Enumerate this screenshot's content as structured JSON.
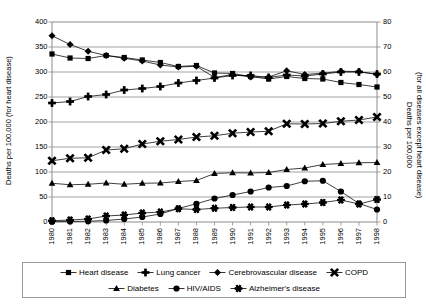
{
  "chart_data": {
    "type": "line",
    "title": "",
    "xlabel": "",
    "categories": [
      "1980",
      "1981",
      "1982",
      "1983",
      "1984",
      "1985",
      "1986",
      "1987",
      "1988",
      "1989",
      "1990",
      "1991",
      "1992",
      "1993",
      "1994",
      "1995",
      "1996",
      "1997",
      "1998"
    ],
    "axes": {
      "left": {
        "label": "Deaths per 100,000 (for heart disease)",
        "ticks": [
          "0",
          "50",
          "100",
          "150",
          "200",
          "250",
          "300",
          "350",
          "400"
        ],
        "lim": [
          0,
          400
        ]
      },
      "right": {
        "label_line1": "Deaths per 100,000",
        "label_line2": "(for all diseases except heart disease)",
        "ticks": [
          "0",
          "10",
          "20",
          "30",
          "40",
          "50",
          "60",
          "70",
          "80"
        ],
        "lim": [
          0,
          80
        ]
      }
    },
    "grid": true,
    "legend_position": "bottom",
    "series": [
      {
        "name": "Heart disease",
        "axis": "left",
        "marker": "square",
        "values": [
          336,
          328,
          327,
          333,
          329,
          324,
          319,
          311,
          313,
          298,
          297,
          291,
          286,
          291,
          287,
          286,
          279,
          275,
          270
        ]
      },
      {
        "name": "Lung cancer",
        "axis": "left",
        "marker": "plus",
        "values": [
          238,
          241,
          251,
          255,
          264,
          267,
          271,
          278,
          283,
          288,
          293,
          293,
          289,
          294,
          292,
          296,
          300,
          300,
          296
        ]
      },
      {
        "name": "Cerebrovascular disease",
        "axis": "right",
        "marker": "diamond",
        "values": [
          74.5,
          71.0,
          68.3,
          66.6,
          65.5,
          64.4,
          62.8,
          62.0,
          62.3,
          57.8,
          59.0,
          58.0,
          58.0,
          60.5,
          59.0,
          59.5,
          60.3,
          60.2,
          59.0
        ]
      },
      {
        "name": "COPD",
        "axis": "right",
        "marker": "x",
        "values": [
          24.5,
          25.5,
          25.7,
          28.8,
          29.3,
          31.2,
          32.3,
          33.0,
          34.0,
          34.5,
          35.5,
          36.0,
          36.3,
          39.3,
          39.2,
          39.4,
          40.3,
          40.8,
          42.0
        ]
      },
      {
        "name": "Diabetes",
        "axis": "right",
        "marker": "triangle",
        "values": [
          15.5,
          14.9,
          15.1,
          15.6,
          15.1,
          15.5,
          15.6,
          16.2,
          16.6,
          19.4,
          19.7,
          19.6,
          19.8,
          21.0,
          21.6,
          23.0,
          23.4,
          23.7,
          23.8
        ]
      },
      {
        "name": "HIV/AIDS",
        "axis": "right",
        "marker": "circle",
        "values": [
          0.1,
          0.2,
          0.3,
          0.6,
          1.2,
          2.0,
          3.2,
          5.4,
          7.3,
          9.4,
          10.8,
          12.2,
          13.8,
          14.4,
          16.3,
          16.5,
          12.2,
          7.4,
          5.0
        ]
      },
      {
        "name": "Alzheimer's disease",
        "axis": "right",
        "marker": "asterisk",
        "values": [
          0.5,
          0.8,
          1.2,
          2.4,
          2.8,
          3.6,
          4.0,
          5.3,
          5.0,
          5.5,
          5.8,
          6.0,
          6.0,
          6.8,
          7.2,
          7.8,
          8.8,
          7.2,
          9.0
        ]
      }
    ]
  }
}
